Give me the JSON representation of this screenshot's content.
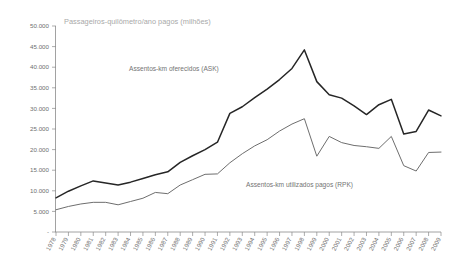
{
  "chart_data": {
    "type": "line",
    "title": "Passageiros-quilômetro/ano pagos (milhões)",
    "xlabel": "",
    "ylabel": "",
    "ylim": [
      0,
      50000
    ],
    "ytick_labels": [
      "50.000",
      "45.000",
      "40.000",
      "35.000",
      "30.000",
      "25.000",
      "20.000",
      "15.000",
      "10.000",
      "5.000",
      "-"
    ],
    "ytick_values": [
      50000,
      45000,
      40000,
      35000,
      30000,
      25000,
      20000,
      15000,
      10000,
      5000,
      0
    ],
    "grid": false,
    "legend_position": "inline-annotation",
    "categories": [
      "1978",
      "1979",
      "1980",
      "1981",
      "1982",
      "1983",
      "1984",
      "1985",
      "1986",
      "1987",
      "1988",
      "1989",
      "1990",
      "1991",
      "1992",
      "1993",
      "1994",
      "1995",
      "1996",
      "1997",
      "1998",
      "1999",
      "2000",
      "2001",
      "2002",
      "2003",
      "2004",
      "2005",
      "2006",
      "2007",
      "2008",
      "2009"
    ],
    "series": [
      {
        "name": "Assentos-km oferecidos (ASK)",
        "color": "#262626",
        "label_text": "Assentos-km oferecidos (ASK)",
        "values": [
          8300,
          9900,
          11200,
          12400,
          11900,
          11400,
          12100,
          13000,
          13900,
          14600,
          16900,
          18500,
          20000,
          21800,
          28800,
          30400,
          32600,
          34700,
          37000,
          39700,
          44200,
          36500,
          33300,
          32500,
          30600,
          28500,
          30900,
          32200,
          23800,
          24400,
          29600,
          28200
        ]
      },
      {
        "name": "Assentos-km utilizados pagos (RPK)",
        "color": "#6e6e6e",
        "label_text": "Assentos-km utilizados pagos (RPK)",
        "values": [
          5400,
          6200,
          6800,
          7200,
          7200,
          6600,
          7400,
          8200,
          9600,
          9300,
          11400,
          12700,
          14000,
          14100,
          16800,
          19000,
          20900,
          22400,
          24500,
          26200,
          27500,
          18400,
          23200,
          21700,
          21000,
          20700,
          20300,
          23200,
          16100,
          14800,
          19300,
          19400
        ]
      }
    ],
    "annotations": [
      {
        "name": "ask-series-annotation",
        "text": "Assentos-km oferecidos (ASK)",
        "x_px": 129,
        "y_px": 71
      },
      {
        "name": "rpk-series-annotation",
        "text": "Assentos-km utilizados pagos (RPK)",
        "x_px": 246,
        "y_px": 187
      }
    ]
  },
  "colors": {
    "background": "#ffffff",
    "axis": "#8a8a8a",
    "title_text": "#a9a9a9",
    "tick_text": "#6f6f6f",
    "annotation_text": "#747474",
    "ask_line": "#262626",
    "rpk_line": "#6e6e6e"
  }
}
